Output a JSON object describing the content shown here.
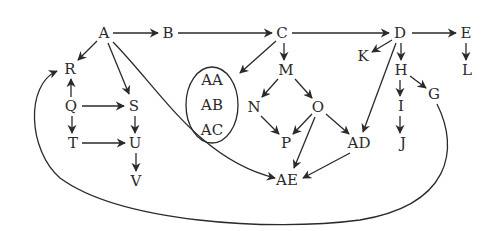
{
  "diagram": {
    "type": "directed-graph",
    "ink_color": "#2a2a2a",
    "background": "#ffffff",
    "nodes": [
      {
        "id": "A",
        "label": "A",
        "x": 104,
        "y": 33
      },
      {
        "id": "B",
        "label": "B",
        "x": 168,
        "y": 33
      },
      {
        "id": "C",
        "label": "C",
        "x": 282,
        "y": 33
      },
      {
        "id": "D",
        "label": "D",
        "x": 400,
        "y": 33
      },
      {
        "id": "E",
        "label": "E",
        "x": 466,
        "y": 33
      },
      {
        "id": "R",
        "label": "R",
        "x": 70,
        "y": 69
      },
      {
        "id": "Q",
        "label": "Q",
        "x": 71,
        "y": 106
      },
      {
        "id": "S",
        "label": "S",
        "x": 134,
        "y": 106
      },
      {
        "id": "T",
        "label": "T",
        "x": 73,
        "y": 143
      },
      {
        "id": "U",
        "label": "U",
        "x": 135,
        "y": 143
      },
      {
        "id": "V",
        "label": "V",
        "x": 136,
        "y": 181
      },
      {
        "id": "M",
        "label": "M",
        "x": 286,
        "y": 70
      },
      {
        "id": "N",
        "label": "N",
        "x": 254,
        "y": 107
      },
      {
        "id": "O",
        "label": "O",
        "x": 318,
        "y": 107
      },
      {
        "id": "P",
        "label": "P",
        "x": 286,
        "y": 143
      },
      {
        "id": "AD",
        "label": "AD",
        "x": 359,
        "y": 143
      },
      {
        "id": "AE",
        "label": "AE",
        "x": 287,
        "y": 180
      },
      {
        "id": "K",
        "label": "K",
        "x": 363,
        "y": 56
      },
      {
        "id": "H",
        "label": "H",
        "x": 401,
        "y": 70
      },
      {
        "id": "I",
        "label": "I",
        "x": 401,
        "y": 106
      },
      {
        "id": "J",
        "label": "J",
        "x": 403,
        "y": 143
      },
      {
        "id": "G",
        "label": "G",
        "x": 434,
        "y": 94
      },
      {
        "id": "L",
        "label": "L",
        "x": 467,
        "y": 70
      },
      {
        "id": "AA",
        "label": "AA",
        "x": 212,
        "y": 80
      },
      {
        "id": "AB",
        "label": "AB",
        "x": 212,
        "y": 105
      },
      {
        "id": "AC",
        "label": "AC",
        "x": 212,
        "y": 130
      }
    ],
    "group": {
      "label": "AA, AB, AC",
      "members": [
        "AA",
        "AB",
        "AC"
      ],
      "shape": "oval"
    },
    "edges": [
      {
        "from": "A",
        "to": "B"
      },
      {
        "from": "B",
        "to": "C"
      },
      {
        "from": "C",
        "to": "D"
      },
      {
        "from": "D",
        "to": "E"
      },
      {
        "from": "A",
        "to": "R"
      },
      {
        "from": "A",
        "to": "S"
      },
      {
        "from": "A",
        "to": "AE"
      },
      {
        "from": "Q",
        "to": "R"
      },
      {
        "from": "Q",
        "to": "S"
      },
      {
        "from": "Q",
        "to": "T"
      },
      {
        "from": "S",
        "to": "U"
      },
      {
        "from": "T",
        "to": "U"
      },
      {
        "from": "U",
        "to": "V"
      },
      {
        "from": "C",
        "to": "AA/AB/AC group"
      },
      {
        "from": "C",
        "to": "M"
      },
      {
        "from": "M",
        "to": "N"
      },
      {
        "from": "M",
        "to": "O"
      },
      {
        "from": "N",
        "to": "P"
      },
      {
        "from": "O",
        "to": "P"
      },
      {
        "from": "O",
        "to": "AE"
      },
      {
        "from": "O",
        "to": "AD"
      },
      {
        "from": "AD",
        "to": "AE"
      },
      {
        "from": "D",
        "to": "K"
      },
      {
        "from": "D",
        "to": "H"
      },
      {
        "from": "D",
        "to": "AD"
      },
      {
        "from": "H",
        "to": "I"
      },
      {
        "from": "H",
        "to": "G"
      },
      {
        "from": "I",
        "to": "J"
      },
      {
        "from": "E",
        "to": "L"
      },
      {
        "from": "G",
        "to": "R"
      }
    ]
  }
}
